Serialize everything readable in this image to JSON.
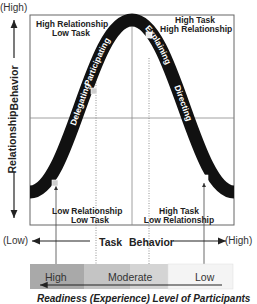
{
  "diagram": {
    "y_axis": {
      "title_part1": "Relationship",
      "title_part2": "Behavior",
      "high_label": "(High)",
      "low_label": "(Low)"
    },
    "x_axis": {
      "title_part1": "Task",
      "title_part2": "Behavior",
      "low_label": "(Low)",
      "high_label": "(High)"
    },
    "quadrants": [
      {
        "id": "top-left",
        "line1": "High   Relationship",
        "line2": "Low   Task"
      },
      {
        "id": "top-right",
        "line1": "High   Task",
        "line2": "High   Relationship"
      },
      {
        "id": "bottom-left",
        "line1": "Low   Relationship",
        "line2": "Low   Task"
      },
      {
        "id": "bottom-right",
        "line1": "High   Task",
        "line2": "Low   Relationship"
      }
    ],
    "curve_styles": [
      {
        "label": "Delegating"
      },
      {
        "label": "Participating"
      },
      {
        "label": "Explaining"
      },
      {
        "label": "Directing"
      }
    ],
    "readiness_band": {
      "segments": [
        {
          "label": "High",
          "color": "#a9a9a9"
        },
        {
          "label": "Moderate",
          "color": "#c8c8c8"
        },
        {
          "label": "",
          "color": "#d6d6d6"
        },
        {
          "label": "Low",
          "color": "#f4f4f4"
        }
      ]
    },
    "caption": "Readiness (Experience) Level of Participants",
    "colors": {
      "curve": "#111111",
      "frame": "#555555",
      "marker": "#cfcfcf"
    }
  }
}
